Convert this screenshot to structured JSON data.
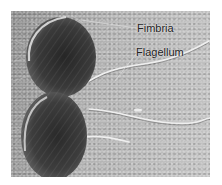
{
  "figure": {
    "labels": {
      "fimbria": "Fimbria",
      "flagellum": "Flagellum"
    },
    "colors": {
      "background": "#ffffff",
      "substrate": "#a9a9a9",
      "cell_body": "#3a3a3a",
      "flagella": "#eeeeee"
    }
  }
}
